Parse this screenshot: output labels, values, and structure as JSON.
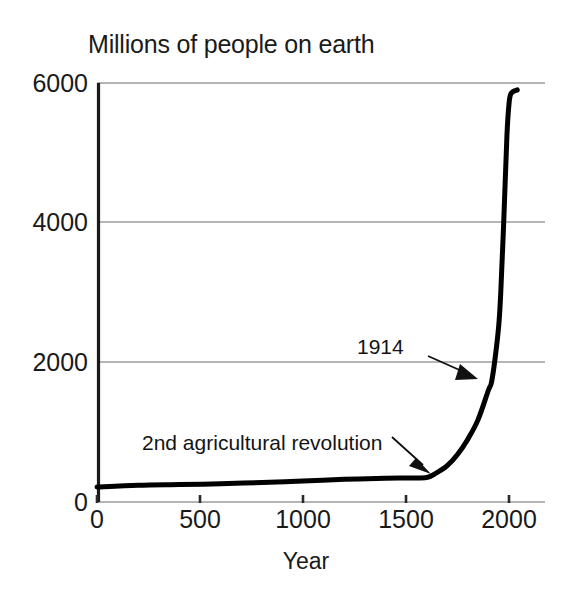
{
  "chart_data": {
    "type": "line",
    "title": "Millions of people on earth",
    "xlabel": "Year",
    "ylabel": "",
    "xlim": [
      0,
      2100
    ],
    "ylim": [
      0,
      6000
    ],
    "grid": true,
    "legend": "none",
    "xticks": [
      "0",
      "500",
      "1000",
      "1500",
      "2000"
    ],
    "xtick_values": [
      0,
      500,
      1000,
      1500,
      2000
    ],
    "yticks": [
      "0",
      "2000",
      "4000",
      "6000"
    ],
    "ytick_values": [
      0,
      2000,
      4000,
      6000
    ],
    "series": [
      {
        "name": "World population",
        "x": [
          0,
          200,
          400,
          600,
          800,
          1000,
          1200,
          1400,
          1500,
          1600,
          1650,
          1700,
          1750,
          1800,
          1850,
          1900,
          1914,
          1930,
          1950,
          1960,
          1975,
          1990,
          2000,
          2010,
          2040
        ],
        "values": [
          215,
          240,
          250,
          260,
          280,
          300,
          325,
          340,
          345,
          350,
          420,
          520,
          680,
          900,
          1180,
          1600,
          1700,
          2000,
          2520,
          3000,
          4060,
          5250,
          5700,
          5850,
          5900
        ]
      }
    ],
    "annotations": [
      {
        "label": "2nd agricultural revolution",
        "points_to_x": 1600,
        "points_to_y": 350
      },
      {
        "label": "1914",
        "points_to_x": 1914,
        "points_to_y": 1700
      }
    ],
    "colors": {
      "series": "#000000",
      "gridline": "#9d9d9d",
      "axis": "#1a1a1a",
      "background": "#ffffff"
    }
  }
}
